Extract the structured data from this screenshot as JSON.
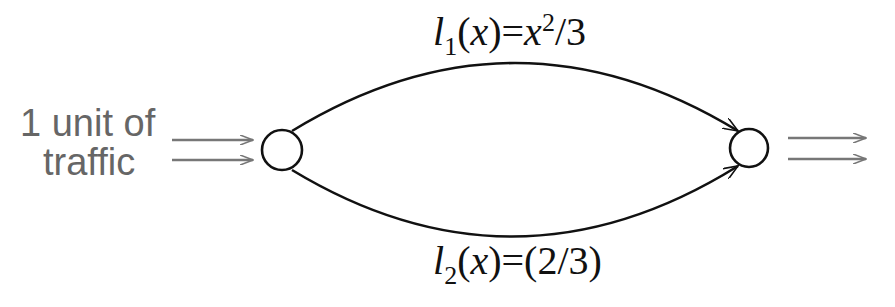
{
  "diagram": {
    "type": "network-flow",
    "source_label": {
      "line1": "1 unit of",
      "line2": "traffic"
    },
    "nodes": [
      {
        "id": "source",
        "cx": 282,
        "cy": 150,
        "r": 20
      },
      {
        "id": "sink",
        "cx": 749,
        "cy": 148,
        "r": 19
      }
    ],
    "edges": [
      {
        "id": "top-edge",
        "from": "source",
        "to": "sink",
        "label": {
          "l": "l",
          "sub": "1",
          "open": "(",
          "x": "x",
          "close_eq": ")=",
          "x2": "x",
          "sup": "2",
          "rest": "/3"
        }
      },
      {
        "id": "bottom-edge",
        "from": "source",
        "to": "sink",
        "label": {
          "l": "l",
          "sub": "2",
          "open": "(",
          "x": "x",
          "close_eq": ")=(2/3)"
        }
      }
    ],
    "colors": {
      "stroke": "#111111",
      "arrow_gray": "#777777",
      "text_gray": "#666666"
    }
  }
}
